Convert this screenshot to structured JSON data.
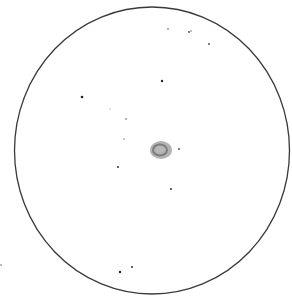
{
  "sketch": {
    "background": "#ffffff",
    "field_of_view": {
      "cx": 152,
      "cy": 150.5,
      "rx": 137.5,
      "ry": 143.5,
      "stroke": "#3a3a3a",
      "stroke_width": 1.3
    },
    "nebula": {
      "cx": 161,
      "cy": 150,
      "outer_rx": 11,
      "outer_ry": 9,
      "outer_color": "#9a9a9a",
      "ring_rx": 7,
      "ring_ry": 5.5,
      "ring_color": "#7d7d7d",
      "core_rx": 4,
      "core_ry": 3,
      "core_color": "#b8b8b8"
    },
    "stars": [
      {
        "x": 168,
        "y": 29,
        "r": 0.8,
        "color": "#555555"
      },
      {
        "x": 189,
        "y": 32,
        "r": 0.9,
        "color": "#444444"
      },
      {
        "x": 191,
        "y": 31,
        "r": 0.7,
        "color": "#555555"
      },
      {
        "x": 209,
        "y": 44,
        "r": 0.9,
        "color": "#444444"
      },
      {
        "x": 162,
        "y": 81,
        "r": 1.2,
        "color": "#222222"
      },
      {
        "x": 82,
        "y": 97,
        "r": 1.3,
        "color": "#222222"
      },
      {
        "x": 110,
        "y": 109,
        "r": 0.6,
        "color": "#888888"
      },
      {
        "x": 126,
        "y": 119,
        "r": 0.8,
        "color": "#555555"
      },
      {
        "x": 124,
        "y": 139,
        "r": 0.7,
        "color": "#666666"
      },
      {
        "x": 179,
        "y": 149,
        "r": 0.9,
        "color": "#444444"
      },
      {
        "x": 118,
        "y": 167,
        "r": 1.0,
        "color": "#333333"
      },
      {
        "x": 171,
        "y": 189,
        "r": 1.0,
        "color": "#333333"
      },
      {
        "x": 132,
        "y": 267,
        "r": 1.0,
        "color": "#333333"
      },
      {
        "x": 120,
        "y": 272,
        "r": 1.2,
        "color": "#222222"
      },
      {
        "x": 1,
        "y": 265,
        "r": 0.8,
        "color": "#666666"
      }
    ]
  }
}
